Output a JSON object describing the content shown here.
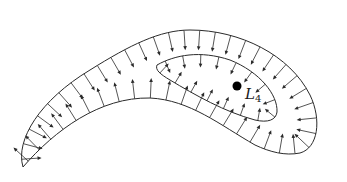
{
  "diagram": {
    "stroke_color": "#2a2a2a",
    "background": "#ffffff",
    "outer_boundary": {
      "path": "M23,167 C15,140 40,100 90,70 C130,45 160,30 190,30 C240,30 290,55 310,95 C322,120 318,148 300,153 C285,156 270,152 255,145 C220,125 190,100 150,98 C100,97 55,130 23,167 Z",
      "arrow_count": 48,
      "arrow_length": 20,
      "arrow_direction": "outward"
    },
    "inner_lobe": {
      "path": "M157,65 C175,55 200,50 230,60 C260,72 278,95 277,112 C276,120 268,123 255,120 C225,112 195,95 170,80 C160,74 155,70 157,65 Z",
      "arrow_count": 16,
      "arrow_length": 13,
      "arrow_direction": "outward"
    },
    "point": {
      "x": 237,
      "y": 86,
      "r": 4.5
    },
    "label": {
      "main": "L",
      "sub": "4",
      "x": 245,
      "y": 99
    }
  }
}
